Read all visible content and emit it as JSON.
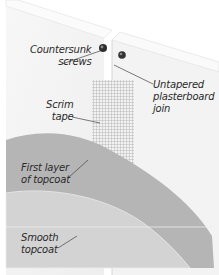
{
  "diagram": {
    "colors": {
      "background": "#ffffff",
      "board": "#f4f4f4",
      "board_edge": "#e2e2e2",
      "scrim_tape": "#bdbdbd",
      "first_coat": "#b3b3b3",
      "smooth_coat": "#d2d2d2",
      "screw": "#3a3a3a",
      "leader_line": "#444444",
      "text": "#2a2a2a"
    },
    "labels": {
      "countersunk_screws": {
        "line1": "Countersunk",
        "line2": "screws"
      },
      "untapered_join": {
        "line1": "Untapered",
        "line2": "plasterboard",
        "line3": "join"
      },
      "scrim_tape": {
        "line1": "Scrim",
        "line2": "tape"
      },
      "first_layer": {
        "line1": "First layer",
        "line2": "of topcoat"
      },
      "smooth_topcoat": {
        "line1": "Smooth",
        "line2": "topcoat"
      }
    }
  }
}
